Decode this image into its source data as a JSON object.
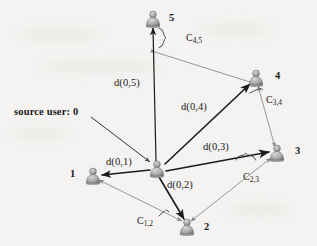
{
  "figure": {
    "background_color": "#f4f3f1",
    "ink_color": "#1a1a1a",
    "thin_edge_color": "#8b8b8b",
    "node_color": "#9b9b9b"
  },
  "source_annotation": {
    "text": "source user: 0",
    "x": 14,
    "y": 107,
    "arrow": {
      "x1": 91,
      "y1": 117,
      "x2": 151,
      "y2": 162
    }
  },
  "nodes": [
    {
      "id": "0",
      "label": "",
      "icon": "user-bust-icon",
      "x": 157,
      "y": 169,
      "label_x": 0,
      "label_y": 0,
      "is_source": true
    },
    {
      "id": "1",
      "label": "1",
      "icon": "user-bust-icon",
      "x": 93,
      "y": 176,
      "label_x": 70,
      "label_y": 169,
      "is_source": false
    },
    {
      "id": "2",
      "label": "2",
      "icon": "user-bust-icon",
      "x": 187,
      "y": 227,
      "label_x": 204,
      "label_y": 222,
      "is_source": false
    },
    {
      "id": "3",
      "label": "3",
      "icon": "user-bust-icon",
      "x": 277,
      "y": 153,
      "label_x": 295,
      "label_y": 146,
      "is_source": false
    },
    {
      "id": "4",
      "label": "4",
      "icon": "user-bust-icon",
      "x": 256,
      "y": 78,
      "label_x": 275,
      "label_y": 71,
      "is_source": false
    },
    {
      "id": "5",
      "label": "5",
      "icon": "user-bust-icon",
      "x": 153,
      "y": 19,
      "label_x": 169,
      "label_y": 13,
      "is_source": false
    }
  ],
  "broadcast_edges": [
    {
      "name": "d(0,1)",
      "from": "0",
      "to": "1",
      "x1": 150,
      "y1": 170,
      "x2": 101,
      "y2": 175,
      "label": "d(0,1)",
      "label_x": 106,
      "label_y": 157
    },
    {
      "name": "d(0,2)",
      "from": "0",
      "to": "2",
      "x1": 159,
      "y1": 177,
      "x2": 184,
      "y2": 219,
      "label": "d(0,2)",
      "label_x": 167,
      "label_y": 180
    },
    {
      "name": "d(0,3)",
      "from": "0",
      "to": "3",
      "x1": 166,
      "y1": 170,
      "x2": 269,
      "y2": 152,
      "label": "d(0,3)",
      "label_x": 203,
      "label_y": 142
    },
    {
      "name": "d(0,4)",
      "from": "0",
      "to": "4",
      "x1": 165,
      "y1": 164,
      "x2": 250,
      "y2": 84,
      "label": "d(0,4)",
      "label_x": 181,
      "label_y": 102
    },
    {
      "name": "d(0,5)",
      "from": "0",
      "to": "5",
      "x1": 156,
      "y1": 161,
      "x2": 153,
      "y2": 28,
      "label": "d(0,5)",
      "label_x": 114,
      "label_y": 78
    }
  ],
  "capacity_edges": [
    {
      "name": "C(1,2)",
      "from": "1",
      "to": "2",
      "x1": 99,
      "y1": 180,
      "x2": 182,
      "y2": 221,
      "label": "C",
      "sub": "1,2",
      "label_x": 137,
      "label_y": 216
    },
    {
      "name": "C(2,3)",
      "from": "2",
      "to": "3",
      "x1": 191,
      "y1": 221,
      "x2": 271,
      "y2": 158,
      "label": "C",
      "sub": "2,3",
      "label_x": 243,
      "label_y": 172
    },
    {
      "name": "C(3,4)",
      "from": "3",
      "to": "4",
      "x1": 275,
      "y1": 147,
      "x2": 257,
      "y2": 85,
      "label": "C",
      "sub": "3,4",
      "label_x": 266,
      "label_y": 99
    },
    {
      "name": "C(4,5)",
      "from": "4",
      "to": "5",
      "x1": 250,
      "y1": 82,
      "x2": 155,
      "y2": 52,
      "label": "C",
      "sub": "4,5",
      "label_x": 186,
      "label_y": 33
    }
  ],
  "braces": [
    {
      "name": "brace-c45",
      "x": 161,
      "y": 28,
      "height": 19,
      "orient": "vertical"
    },
    {
      "name": "brace-c34",
      "x": 253,
      "y": 91,
      "orient": "tick"
    },
    {
      "name": "brace-c23",
      "x": 237,
      "y": 158,
      "width": 24,
      "orient": "horizontal"
    },
    {
      "name": "brace-c12",
      "x": 159,
      "y": 212,
      "orient": "tick"
    }
  ]
}
